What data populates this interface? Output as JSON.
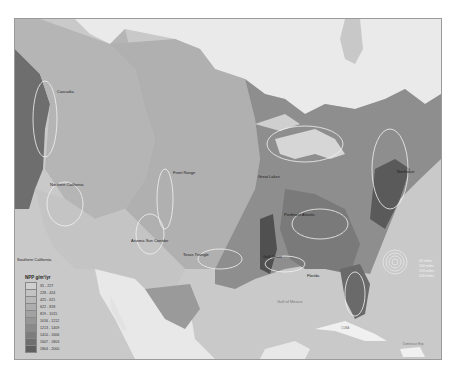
{
  "legend": {
    "title": "NPP g/m²/yr",
    "items": [
      {
        "range": "35 - 227",
        "color": "#cfcfcf"
      },
      {
        "range": "228 - 424",
        "color": "#c3c3c3"
      },
      {
        "range": "425 - 621",
        "color": "#b8b8b8"
      },
      {
        "range": "622 - 818",
        "color": "#adadad"
      },
      {
        "range": "819 - 1015",
        "color": "#a2a2a2"
      },
      {
        "range": "1016 - 1212",
        "color": "#969696"
      },
      {
        "range": "1213 - 1409",
        "color": "#8a8a8a"
      },
      {
        "range": "1410 - 1606",
        "color": "#7d7d7d"
      },
      {
        "range": "1607 - 1803",
        "color": "#6f6f6f"
      },
      {
        "range": "1804 - 2000",
        "color": "#606060"
      }
    ]
  },
  "regions": {
    "cascadia": "Cascadia",
    "northern_california": "Northern California",
    "southern_california": "Southern California",
    "front_range": "Front Range",
    "arizona_sun_corridor": "Arizona Sun Corridor",
    "texas_triangle": "Texas Triangle",
    "great_lakes": "Great Lakes",
    "piedmont_atlantic": "Piedmont Atlantic",
    "gulf_coast": "Gulf Coast",
    "florida": "Florida",
    "northeast": "Northeast"
  },
  "water_labels": {
    "gulf_of_mexico": "Gulf of Mexico",
    "cuba": "CUBA",
    "dominican": "Dominican Rep."
  },
  "symbol_legend": [
    "50 miles",
    "100 miles",
    "150 miles",
    "200 miles"
  ],
  "colors": {
    "water": "#c9c9c9",
    "no_data_land": "#e9e9e9",
    "background": "#ffffff"
  }
}
